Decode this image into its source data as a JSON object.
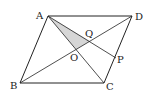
{
  "diagram": {
    "type": "geometry",
    "shape": "parallelogram ABCD with diagonals AC and BD meeting at O; segment AP with P on CD meets BD at Q; triangle AOQ shaded",
    "points": {
      "A": {
        "label": "A",
        "x": 48,
        "y": 16
      },
      "B": {
        "label": "B",
        "x": 20,
        "y": 83
      },
      "C": {
        "label": "C",
        "x": 104,
        "y": 83
      },
      "D": {
        "label": "D",
        "x": 132,
        "y": 16
      },
      "O": {
        "label": "O",
        "x": 76,
        "y": 49
      },
      "P": {
        "label": "P",
        "x": 115,
        "y": 57
      },
      "Q": {
        "label": "Q",
        "x": 90,
        "y": 41
      }
    },
    "shaded_region": [
      "A",
      "O",
      "Q"
    ],
    "colors": {
      "line": "#222222",
      "shade": "#d4d4d4"
    }
  }
}
